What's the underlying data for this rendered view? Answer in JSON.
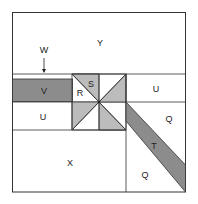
{
  "diagram": {
    "labels": {
      "Y": "Y",
      "W": "W",
      "V": "V",
      "R": "R",
      "S": "S",
      "U_left": "U",
      "U_right": "U",
      "Q_upper": "Q",
      "Q_lower": "Q",
      "T": "T",
      "X": "X"
    },
    "colors": {
      "dark_gray": "#8c8c8c",
      "light_gray": "#bcbcbc",
      "line": "#333333",
      "background": "#ffffff"
    }
  }
}
